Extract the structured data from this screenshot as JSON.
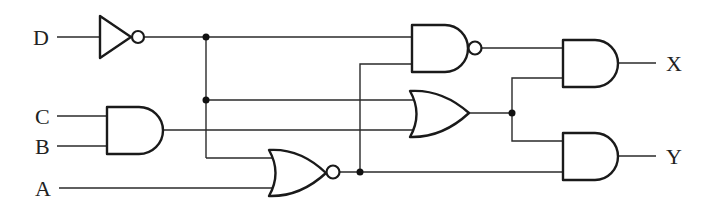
{
  "diagram": {
    "type": "logic-circuit",
    "inputs": [
      {
        "name": "D",
        "label": "D"
      },
      {
        "name": "C",
        "label": "C"
      },
      {
        "name": "B",
        "label": "B"
      },
      {
        "name": "A",
        "label": "A"
      }
    ],
    "outputs": [
      {
        "name": "X",
        "label": "X"
      },
      {
        "name": "Y",
        "label": "Y"
      }
    ],
    "gates": [
      {
        "id": "g1",
        "type": "NOT",
        "inputs": [
          "D"
        ]
      },
      {
        "id": "g2",
        "type": "AND",
        "inputs": [
          "C",
          "B"
        ]
      },
      {
        "id": "g3",
        "type": "NOR",
        "inputs": [
          "g1",
          "A"
        ]
      },
      {
        "id": "g4",
        "type": "NAND",
        "inputs": [
          "g1",
          "g3"
        ]
      },
      {
        "id": "g5",
        "type": "OR",
        "inputs": [
          "g1",
          "g2"
        ]
      },
      {
        "id": "g6",
        "type": "AND",
        "inputs": [
          "g4",
          "g5"
        ],
        "output": "X"
      },
      {
        "id": "g7",
        "type": "AND",
        "inputs": [
          "g5",
          "g3"
        ],
        "output": "Y"
      }
    ]
  }
}
